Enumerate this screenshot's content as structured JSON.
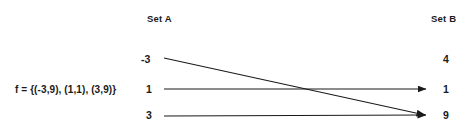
{
  "diagram": {
    "title_left": "Set A",
    "title_right": "Set B",
    "formula": "f = {(-3,9), (1,1), (3,9)}",
    "set_a": [
      {
        "label": "-3"
      },
      {
        "label": "1"
      },
      {
        "label": "3"
      }
    ],
    "set_b": [
      {
        "label": "4"
      },
      {
        "label": "1"
      },
      {
        "label": "9"
      }
    ],
    "mappings": [
      {
        "from": "-3",
        "to": "9"
      },
      {
        "from": "1",
        "to": "1"
      },
      {
        "from": "3",
        "to": "9"
      }
    ],
    "colors": {
      "background": "#ffffff",
      "text": "#1a1a1a",
      "arrow": "#1a1a1a"
    }
  }
}
